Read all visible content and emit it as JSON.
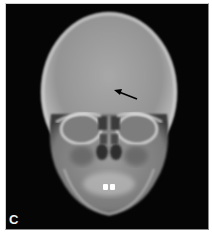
{
  "figure": {
    "panel_label": "C",
    "annotation": {
      "type": "arrow",
      "direction": "pointing up-left toward midline frontal region",
      "color": "#000000"
    },
    "colors": {
      "background": "#050505",
      "bone_light": "#d8d8d8",
      "bone_mid": "#9a9a9a",
      "page_background": "#ffffff"
    }
  }
}
